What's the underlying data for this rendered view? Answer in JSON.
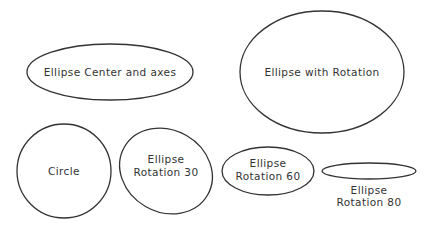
{
  "shapes": [
    {
      "id": "ellipse-center-axes",
      "label": [
        "Ellipse Center and axes"
      ],
      "cx": 110,
      "cy": 72,
      "rx": 83,
      "ry": 28,
      "rotation": 0
    },
    {
      "id": "ellipse-with-rotation",
      "label": [
        "Ellipse with Rotation"
      ],
      "cx": 322,
      "cy": 72,
      "rx": 82,
      "ry": 61,
      "rotation": 0
    },
    {
      "id": "circle",
      "label": [
        "Circle"
      ],
      "cx": 64,
      "cy": 171,
      "rx": 47,
      "ry": 47,
      "rotation": 0
    },
    {
      "id": "ellipse-rotation-30",
      "label": [
        "Ellipse",
        "Rotation  30"
      ],
      "cx": 166,
      "cy": 171,
      "rx": 47,
      "ry": 41,
      "rotation": 30
    },
    {
      "id": "ellipse-rotation-60",
      "label": [
        "Ellipse",
        "Rotation  60"
      ],
      "cx": 268,
      "cy": 171,
      "rx": 46,
      "ry": 24,
      "rotation": 0
    },
    {
      "id": "ellipse-rotation-80",
      "label": [
        "Ellipse",
        "Rotation  80"
      ],
      "cx": 369,
      "cy": 171,
      "rx": 47,
      "ry": 8,
      "rotation": 0
    }
  ],
  "labels": {
    "ellipse_center_axes": "Ellipse Center and axes",
    "ellipse_with_rotation": "Ellipse with Rotation",
    "circle": "Circle",
    "rot30_l1": "Ellipse",
    "rot30_l2": "Rotation  30",
    "rot60_l1": "Ellipse",
    "rot60_l2": "Rotation  60",
    "rot80_l1": "Ellipse",
    "rot80_l2": "Rotation  80"
  },
  "stroke_color": "#333333"
}
